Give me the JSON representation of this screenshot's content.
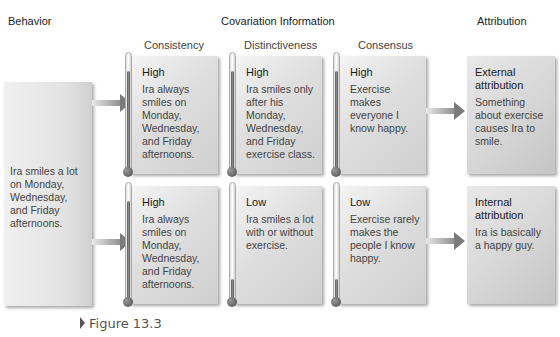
{
  "headers": {
    "behavior": "Behavior",
    "covariation": "Covariation Information",
    "attribution": "Attribution"
  },
  "subheaders": {
    "consistency": "Consistency",
    "distinctiveness": "Distinctiveness",
    "consensus": "Consensus"
  },
  "behavior": {
    "text": "Ira smiles a lot on Monday, Wednesday, and Friday afternoons."
  },
  "rows": [
    {
      "consistency": {
        "level": "High",
        "text": "Ira always smiles on Monday, Wednesday, and Friday afternoons."
      },
      "distinctiveness": {
        "level": "High",
        "text": "Ira smiles only after his Monday, Wednesday, and Friday exercise class."
      },
      "consensus": {
        "level": "High",
        "text": "Exercise makes everyone I know happy."
      },
      "attribution": {
        "title": "External attribution",
        "text": "Something about exercise causes Ira to smile."
      }
    },
    {
      "consistency": {
        "level": "High",
        "text": "Ira always smiles on Monday, Wednesday, and Friday afternoons."
      },
      "distinctiveness": {
        "level": "Low",
        "text": "Ira smiles a lot with or without exercise."
      },
      "consensus": {
        "level": "Low",
        "text": "Exercise rarely makes the people I know happy."
      },
      "attribution": {
        "title": "Internal attribution",
        "text": "Ira is basically a happy guy."
      }
    }
  ],
  "caption": "Figure 13.3",
  "icons": {
    "thermometer_high": "thermometer-high-icon",
    "thermometer_low": "thermometer-low-icon",
    "arrow": "right-arrow-icon",
    "caption_marker": "triangle-marker-icon"
  }
}
